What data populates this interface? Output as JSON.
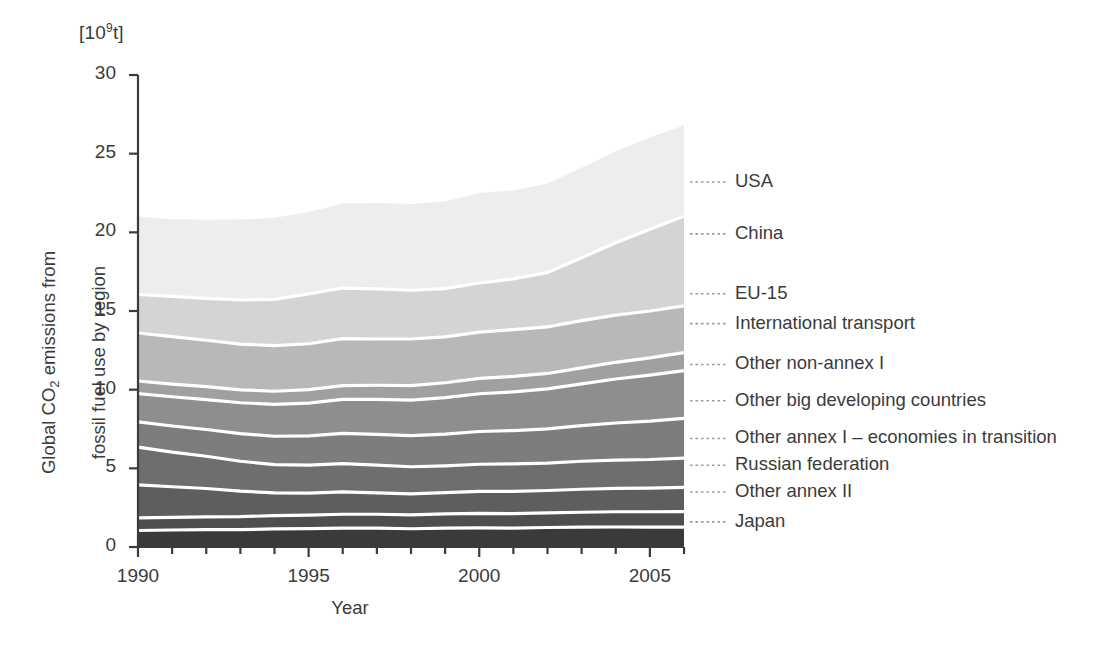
{
  "chart_data": {
    "type": "area",
    "title": "",
    "subtitle": "",
    "xlabel": "Year",
    "ylabel": "Global CO2 emissions from fossil fuel use by region",
    "ylabel_line1": "Global CO",
    "ylabel_sub": "2",
    "ylabel_line1_rest": " emissions from",
    "ylabel_line2": "fossil fuel use by region",
    "unit_label_prefix": "[10",
    "unit_label_exp": "9",
    "unit_label_suffix": "t]",
    "stacked": true,
    "grid": false,
    "legend_position": "right-inline-leader-lines",
    "xlim": [
      1990,
      2006
    ],
    "ylim": [
      0,
      30
    ],
    "yticks": [
      0,
      5,
      10,
      15,
      20,
      25,
      30
    ],
    "ytick_labels": [
      "0",
      "5",
      "10",
      "15",
      "20",
      "25",
      "30"
    ],
    "xticks": [
      1990,
      1995,
      2000,
      2005
    ],
    "xtick_labels": [
      "1990",
      "1995",
      "2000",
      "2005"
    ],
    "x_minor_tick_step": 1,
    "x": [
      1990,
      1991,
      1992,
      1993,
      1994,
      1995,
      1996,
      1997,
      1998,
      1999,
      2000,
      2001,
      2002,
      2003,
      2004,
      2005,
      2006
    ],
    "series": [
      {
        "name": "Japan",
        "color": "#3a3a3a",
        "stack_order": 1,
        "values": [
          1.05,
          1.08,
          1.1,
          1.1,
          1.15,
          1.17,
          1.2,
          1.2,
          1.16,
          1.2,
          1.22,
          1.2,
          1.24,
          1.26,
          1.27,
          1.26,
          1.26
        ]
      },
      {
        "name": "Other annex II",
        "color": "#4e4e4e",
        "stack_order": 2,
        "values": [
          0.8,
          0.8,
          0.82,
          0.83,
          0.84,
          0.85,
          0.88,
          0.88,
          0.88,
          0.9,
          0.92,
          0.92,
          0.93,
          0.95,
          0.97,
          0.98,
          0.99
        ]
      },
      {
        "name": "Russian federation",
        "color": "#5e5e5e",
        "stack_order": 3,
        "values": [
          2.1,
          1.95,
          1.8,
          1.62,
          1.45,
          1.4,
          1.42,
          1.36,
          1.34,
          1.36,
          1.4,
          1.42,
          1.42,
          1.46,
          1.48,
          1.5,
          1.54
        ]
      },
      {
        "name": "Other annex I - economies in transition",
        "color": "#6e6e6e",
        "stack_order": 4,
        "values": [
          2.4,
          2.2,
          2.05,
          1.9,
          1.8,
          1.78,
          1.8,
          1.76,
          1.72,
          1.7,
          1.72,
          1.74,
          1.74,
          1.78,
          1.8,
          1.82,
          1.86
        ]
      },
      {
        "name": "Other big developing countries",
        "color": "#7d7d7d",
        "stack_order": 5,
        "values": [
          1.6,
          1.66,
          1.7,
          1.76,
          1.8,
          1.86,
          1.92,
          1.96,
          1.98,
          2.02,
          2.08,
          2.12,
          2.18,
          2.26,
          2.36,
          2.44,
          2.52
        ]
      },
      {
        "name": "Other non-annex I",
        "color": "#8e8e8e",
        "stack_order": 6,
        "values": [
          1.8,
          1.86,
          1.9,
          1.96,
          2.02,
          2.08,
          2.16,
          2.22,
          2.26,
          2.32,
          2.4,
          2.46,
          2.54,
          2.66,
          2.8,
          2.92,
          3.04
        ]
      },
      {
        "name": "International transport",
        "color": "#a0a0a0",
        "stack_order": 7,
        "values": [
          0.8,
          0.8,
          0.82,
          0.82,
          0.84,
          0.86,
          0.88,
          0.9,
          0.92,
          0.94,
          0.98,
          0.98,
          0.98,
          1.02,
          1.06,
          1.1,
          1.14
        ]
      },
      {
        "name": "EU-15",
        "color": "#b8b8b8",
        "stack_order": 8,
        "values": [
          3.05,
          3.02,
          2.95,
          2.9,
          2.9,
          2.92,
          2.98,
          2.94,
          2.96,
          2.92,
          2.94,
          2.98,
          2.96,
          3.0,
          3.0,
          2.98,
          2.98
        ]
      },
      {
        "name": "China",
        "color": "#d4d4d4",
        "stack_order": 9,
        "values": [
          2.45,
          2.56,
          2.66,
          2.82,
          2.94,
          3.16,
          3.22,
          3.18,
          3.1,
          3.06,
          3.12,
          3.22,
          3.46,
          4.0,
          4.6,
          5.2,
          5.7
        ]
      },
      {
        "name": "USA",
        "color": "#ededed",
        "stack_order": 10,
        "values": [
          4.95,
          4.9,
          5.0,
          5.1,
          5.18,
          5.22,
          5.38,
          5.46,
          5.48,
          5.56,
          5.72,
          5.62,
          5.66,
          5.72,
          5.82,
          5.82,
          5.78
        ]
      }
    ],
    "legend": [
      {
        "label": "USA",
        "y_value": 23.2
      },
      {
        "label": "China",
        "y_value": 19.9
      },
      {
        "label": "EU-15",
        "y_value": 16.1
      },
      {
        "label": "International transport",
        "y_value": 14.2
      },
      {
        "label": "Other non-annex I",
        "y_value": 11.6
      },
      {
        "label": "Other big developing countries",
        "y_value": 9.3
      },
      {
        "label": "Other annex I – economies in transition",
        "y_value": 6.9
      },
      {
        "label": "Russian federation",
        "y_value": 5.2
      },
      {
        "label": "Other annex II",
        "y_value": 3.5
      },
      {
        "label": "Japan",
        "y_value": 1.6
      }
    ]
  }
}
